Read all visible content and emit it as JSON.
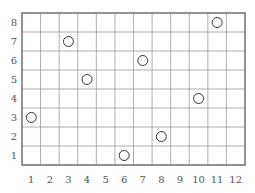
{
  "chart_data": {
    "type": "scatter",
    "title": "",
    "xlabel": "",
    "ylabel": "",
    "x_ticks": [
      "1",
      "2",
      "3",
      "4",
      "5",
      "6",
      "7",
      "8",
      "9",
      "10",
      "11",
      "12"
    ],
    "y_ticks": [
      "1",
      "2",
      "3",
      "4",
      "5",
      "6",
      "7",
      "8"
    ],
    "xlim": [
      0.5,
      12.5
    ],
    "ylim": [
      0.5,
      8.5
    ],
    "grid": true,
    "marker": "open-circle",
    "points": [
      {
        "x": 1,
        "y": 3
      },
      {
        "x": 3,
        "y": 7
      },
      {
        "x": 4,
        "y": 5
      },
      {
        "x": 6,
        "y": 1
      },
      {
        "x": 7,
        "y": 6
      },
      {
        "x": 8,
        "y": 2
      },
      {
        "x": 10,
        "y": 4
      },
      {
        "x": 11,
        "y": 8
      }
    ]
  },
  "colors": {
    "grid": "#9a9a9a",
    "border": "#777777",
    "marker": "#333333",
    "label": "#555555"
  }
}
